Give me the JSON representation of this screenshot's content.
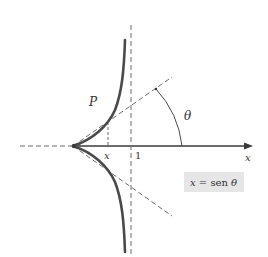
{
  "diagram": {
    "labels": {
      "point": "P",
      "angle": "θ",
      "x_tick": "x",
      "one_tick": "1",
      "axis": "x"
    },
    "formula_box": {
      "var": "x",
      "eq": " = sen ",
      "angle": "θ"
    },
    "colors": {
      "curve": "#4a4a4a",
      "axis": "#3a3a3a",
      "dashed": "#6a6a6a",
      "box_fill": "#e6e6e6"
    }
  }
}
